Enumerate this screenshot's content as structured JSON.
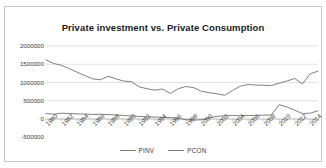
{
  "chart_data": {
    "type": "line",
    "title": "Private investment vs. Private Consumption",
    "xlabel": "",
    "ylabel": "",
    "ylim": [
      -500000,
      2000000
    ],
    "xlim": [
      1980,
      2015
    ],
    "grid": true,
    "legend_position": "bottom",
    "ytick_labels": [
      "2000000",
      "1500000",
      "1000000",
      "500000",
      "0",
      "-500000"
    ],
    "ytick_values": [
      2000000,
      1500000,
      1000000,
      500000,
      0,
      -500000
    ],
    "xtick_labels": [
      "1980",
      "1982",
      "1984",
      "1986",
      "1988",
      "1990",
      "1992",
      "1994",
      "1996",
      "1998",
      "2000",
      "2002",
      "2004",
      "2006",
      "2008",
      "2010",
      "2012",
      "2014"
    ],
    "x": [
      1980,
      1981,
      1982,
      1983,
      1984,
      1985,
      1986,
      1987,
      1988,
      1989,
      1990,
      1991,
      1992,
      1993,
      1994,
      1995,
      1996,
      1997,
      1998,
      1999,
      2000,
      2001,
      2002,
      2003,
      2004,
      2005,
      2006,
      2007,
      2008,
      2009,
      2010,
      2011,
      2012,
      2013,
      2014,
      2015
    ],
    "series": [
      {
        "name": "PINV",
        "color": "#7f7f7f",
        "values": [
          150000,
          130000,
          160000,
          150000,
          140000,
          135000,
          125000,
          130000,
          120000,
          110000,
          95000,
          85000,
          70000,
          60000,
          55000,
          45000,
          40000,
          20000,
          -20000,
          -30000,
          -20000,
          30000,
          75000,
          85000,
          95000,
          90000,
          95000,
          100000,
          105000,
          110000,
          390000,
          330000,
          240000,
          150000,
          160000,
          225000
        ]
      },
      {
        "name": "PCON",
        "color": "#7f7f7f",
        "values": [
          1620000,
          1520000,
          1470000,
          1380000,
          1280000,
          1190000,
          1100000,
          1075000,
          1170000,
          1100000,
          1040000,
          1020000,
          880000,
          830000,
          790000,
          820000,
          700000,
          830000,
          890000,
          860000,
          760000,
          720000,
          690000,
          650000,
          780000,
          900000,
          945000,
          930000,
          925000,
          915000,
          980000,
          1040000,
          1110000,
          960000,
          1240000,
          1310000
        ]
      }
    ]
  },
  "legend": {
    "entries": [
      {
        "label": "PINV"
      },
      {
        "label": "PCON"
      }
    ]
  }
}
